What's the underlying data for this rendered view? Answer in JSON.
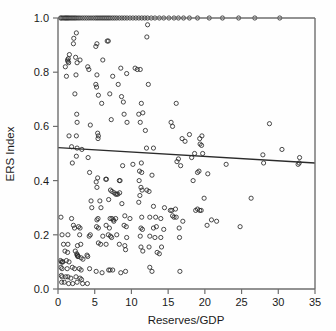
{
  "chart_data": {
    "type": "scatter",
    "title": "",
    "xlabel": "Reserves/GDP",
    "ylabel": "ERS Index",
    "xlim": [
      0,
      35
    ],
    "ylim": [
      0,
      1
    ],
    "xticks": [
      0,
      5,
      10,
      15,
      20,
      25,
      30,
      35
    ],
    "xticklabels": [
      "0",
      "5",
      "10",
      "15",
      "20",
      "25",
      "30",
      "35"
    ],
    "yticks": [
      0.0,
      0.2,
      0.4,
      0.6,
      0.8,
      1.0
    ],
    "yticklabels": [
      "0.0",
      "0.2",
      "0.4",
      "0.6",
      "0.8",
      "1.0"
    ],
    "grid": false,
    "legend": null,
    "marker": "open-circle",
    "marker_color": "#2b2b2b",
    "series": [
      {
        "name": "observations",
        "points": [
          [
            0.35,
            1.0
          ],
          [
            0.5,
            1.0
          ],
          [
            0.7,
            1.0
          ],
          [
            0.9,
            1.0
          ],
          [
            1.05,
            1.0
          ],
          [
            1.2,
            1.0
          ],
          [
            1.35,
            1.0
          ],
          [
            1.5,
            1.0
          ],
          [
            1.7,
            1.0
          ],
          [
            1.9,
            1.0
          ],
          [
            2.1,
            1.0
          ],
          [
            2.3,
            1.0
          ],
          [
            2.5,
            1.0
          ],
          [
            2.75,
            1.0
          ],
          [
            3.0,
            1.0
          ],
          [
            3.3,
            1.0
          ],
          [
            3.6,
            1.0
          ],
          [
            3.9,
            1.0
          ],
          [
            4.2,
            1.0
          ],
          [
            4.5,
            1.0
          ],
          [
            4.8,
            1.0
          ],
          [
            5.1,
            1.0
          ],
          [
            5.35,
            1.0
          ],
          [
            5.6,
            1.0
          ],
          [
            5.85,
            1.0
          ],
          [
            6.1,
            1.0
          ],
          [
            6.35,
            1.0
          ],
          [
            6.6,
            1.0
          ],
          [
            6.85,
            1.0
          ],
          [
            7.1,
            1.0
          ],
          [
            7.4,
            1.0
          ],
          [
            7.7,
            1.0
          ],
          [
            8.0,
            1.0
          ],
          [
            8.35,
            1.0
          ],
          [
            8.7,
            1.0
          ],
          [
            9.05,
            1.0
          ],
          [
            9.4,
            1.0
          ],
          [
            9.8,
            1.0
          ],
          [
            10.2,
            1.0
          ],
          [
            10.6,
            1.0
          ],
          [
            11.0,
            1.0
          ],
          [
            11.4,
            1.0
          ],
          [
            11.8,
            1.0
          ],
          [
            12.2,
            1.0
          ],
          [
            12.7,
            1.0
          ],
          [
            13.2,
            1.0
          ],
          [
            13.8,
            1.0
          ],
          [
            14.4,
            1.0
          ],
          [
            15.1,
            1.0
          ],
          [
            15.8,
            1.0
          ],
          [
            16.4,
            1.0
          ],
          [
            17.1,
            1.0
          ],
          [
            17.9,
            1.0
          ],
          [
            19.0,
            1.0
          ],
          [
            20.6,
            1.0
          ],
          [
            22.4,
            1.0
          ],
          [
            24.6,
            1.0
          ],
          [
            26.8,
            1.0
          ],
          [
            30.2,
            1.0
          ],
          [
            12.2,
            0.975
          ],
          [
            2.5,
            0.945
          ],
          [
            2.15,
            0.925
          ],
          [
            2.1,
            0.905
          ],
          [
            12.1,
            0.93
          ],
          [
            5.3,
            0.905
          ],
          [
            6.7,
            0.915
          ],
          [
            6.85,
            0.915
          ],
          [
            5.15,
            0.895
          ],
          [
            1.55,
            0.865
          ],
          [
            1.4,
            0.85
          ],
          [
            1.3,
            0.845
          ],
          [
            1.35,
            0.84
          ],
          [
            1.45,
            0.835
          ],
          [
            2.4,
            0.855
          ],
          [
            3.0,
            0.845
          ],
          [
            6.1,
            0.845
          ],
          [
            1.0,
            0.82
          ],
          [
            2.6,
            0.835
          ],
          [
            4.05,
            0.82
          ],
          [
            4.2,
            0.81
          ],
          [
            8.55,
            0.815
          ],
          [
            10.5,
            0.815
          ],
          [
            11.2,
            0.81
          ],
          [
            9.35,
            0.795
          ],
          [
            10.8,
            0.81
          ],
          [
            1.15,
            0.785
          ],
          [
            2.45,
            0.79
          ],
          [
            5.3,
            0.79
          ],
          [
            7.45,
            0.785
          ],
          [
            5.15,
            0.755
          ],
          [
            5.25,
            0.745
          ],
          [
            8.2,
            0.755
          ],
          [
            12.3,
            0.755
          ],
          [
            2.3,
            0.72
          ],
          [
            5.5,
            0.715
          ],
          [
            7.05,
            0.72
          ],
          [
            8.65,
            0.71
          ],
          [
            5.95,
            0.685
          ],
          [
            8.9,
            0.69
          ],
          [
            11.35,
            0.685
          ],
          [
            16.1,
            0.685
          ],
          [
            2.55,
            0.645
          ],
          [
            9.0,
            0.645
          ],
          [
            11.0,
            0.645
          ],
          [
            11.55,
            0.65
          ],
          [
            2.6,
            0.615
          ],
          [
            4.4,
            0.605
          ],
          [
            7.25,
            0.625
          ],
          [
            9.4,
            0.615
          ],
          [
            11.2,
            0.615
          ],
          [
            15.4,
            0.615
          ],
          [
            28.8,
            0.61
          ],
          [
            11.9,
            0.585
          ],
          [
            15.6,
            0.6
          ],
          [
            1.5,
            0.565
          ],
          [
            2.5,
            0.565
          ],
          [
            5.4,
            0.575
          ],
          [
            5.5,
            0.565
          ],
          [
            5.45,
            0.555
          ],
          [
            17.9,
            0.57
          ],
          [
            19.3,
            0.555
          ],
          [
            19.6,
            0.565
          ],
          [
            16.9,
            0.555
          ],
          [
            17.3,
            0.545
          ],
          [
            19.35,
            0.535
          ],
          [
            19.55,
            0.53
          ],
          [
            12.05,
            0.52
          ],
          [
            13.0,
            0.52
          ],
          [
            1.85,
            0.525
          ],
          [
            2.6,
            0.52
          ],
          [
            3.25,
            0.515
          ],
          [
            18.6,
            0.5
          ],
          [
            19.7,
            0.5
          ],
          [
            27.9,
            0.495
          ],
          [
            30.5,
            0.515
          ],
          [
            2.5,
            0.49
          ],
          [
            4.1,
            0.485
          ],
          [
            16.4,
            0.48
          ],
          [
            18.2,
            0.485
          ],
          [
            32.9,
            0.485
          ],
          [
            1.95,
            0.465
          ],
          [
            11.35,
            0.465
          ],
          [
            16.2,
            0.47
          ],
          [
            22.9,
            0.46
          ],
          [
            28.0,
            0.465
          ],
          [
            32.7,
            0.46
          ],
          [
            32.85,
            0.465
          ],
          [
            8.8,
            0.455
          ],
          [
            10.2,
            0.46
          ],
          [
            16.7,
            0.455
          ],
          [
            4.3,
            0.43
          ],
          [
            11.1,
            0.435
          ],
          [
            11.4,
            0.43
          ],
          [
            19.0,
            0.43
          ],
          [
            19.2,
            0.435
          ],
          [
            20.4,
            0.425
          ],
          [
            12.8,
            0.42
          ],
          [
            5.4,
            0.41
          ],
          [
            5.2,
            0.395
          ],
          [
            6.5,
            0.405
          ],
          [
            6.6,
            0.405
          ],
          [
            8.35,
            0.4
          ],
          [
            8.45,
            0.4
          ],
          [
            11.05,
            0.4
          ],
          [
            18.4,
            0.4
          ],
          [
            5.3,
            0.375
          ],
          [
            11.3,
            0.375
          ],
          [
            11.45,
            0.365
          ],
          [
            12.1,
            0.365
          ],
          [
            7.15,
            0.365
          ],
          [
            7.35,
            0.36
          ],
          [
            7.65,
            0.355
          ],
          [
            7.85,
            0.35
          ],
          [
            8.0,
            0.35
          ],
          [
            8.15,
            0.35
          ],
          [
            8.4,
            0.355
          ],
          [
            11.15,
            0.345
          ],
          [
            12.4,
            0.36
          ],
          [
            19.9,
            0.335
          ],
          [
            26.3,
            0.335
          ],
          [
            4.5,
            0.325
          ],
          [
            5.7,
            0.325
          ],
          [
            6.9,
            0.33
          ],
          [
            8.7,
            0.315
          ],
          [
            11.0,
            0.32
          ],
          [
            13.0,
            0.305
          ],
          [
            14.5,
            0.3
          ],
          [
            15.3,
            0.29
          ],
          [
            15.5,
            0.29
          ],
          [
            16.0,
            0.295
          ],
          [
            18.75,
            0.29
          ],
          [
            19.0,
            0.295
          ],
          [
            19.3,
            0.29
          ],
          [
            19.5,
            0.29
          ],
          [
            4.6,
            0.3
          ],
          [
            5.85,
            0.3
          ],
          [
            0.4,
            0.265
          ],
          [
            1.85,
            0.26
          ],
          [
            5.3,
            0.255
          ],
          [
            5.45,
            0.26
          ],
          [
            7.1,
            0.26
          ],
          [
            7.35,
            0.26
          ],
          [
            7.55,
            0.255
          ],
          [
            7.6,
            0.25
          ],
          [
            7.85,
            0.26
          ],
          [
            9.1,
            0.27
          ],
          [
            9.8,
            0.26
          ],
          [
            11.4,
            0.265
          ],
          [
            12.5,
            0.265
          ],
          [
            13.3,
            0.265
          ],
          [
            14.0,
            0.26
          ],
          [
            15.6,
            0.27
          ],
          [
            15.8,
            0.265
          ],
          [
            16.1,
            0.265
          ],
          [
            20.9,
            0.255
          ],
          [
            21.6,
            0.25
          ],
          [
            17.0,
            0.25
          ],
          [
            24.8,
            0.23
          ],
          [
            2.1,
            0.235
          ],
          [
            2.25,
            0.225
          ],
          [
            2.8,
            0.23
          ],
          [
            3.0,
            0.225
          ],
          [
            5.25,
            0.23
          ],
          [
            5.5,
            0.225
          ],
          [
            6.55,
            0.235
          ],
          [
            7.0,
            0.225
          ],
          [
            9.0,
            0.235
          ],
          [
            9.3,
            0.23
          ],
          [
            11.3,
            0.225
          ],
          [
            11.5,
            0.22
          ],
          [
            13.0,
            0.225
          ],
          [
            13.4,
            0.23
          ],
          [
            14.4,
            0.22
          ],
          [
            16.5,
            0.225
          ],
          [
            20.3,
            0.235
          ],
          [
            0.55,
            0.2
          ],
          [
            1.35,
            0.2
          ],
          [
            2.95,
            0.2
          ],
          [
            4.25,
            0.195
          ],
          [
            4.4,
            0.2
          ],
          [
            6.1,
            0.195
          ],
          [
            6.85,
            0.2
          ],
          [
            7.15,
            0.195
          ],
          [
            7.3,
            0.19
          ],
          [
            8.0,
            0.2
          ],
          [
            9.35,
            0.19
          ],
          [
            11.2,
            0.195
          ],
          [
            12.5,
            0.195
          ],
          [
            13.2,
            0.19
          ],
          [
            14.0,
            0.19
          ],
          [
            16.55,
            0.19
          ],
          [
            0.75,
            0.165
          ],
          [
            1.35,
            0.165
          ],
          [
            2.65,
            0.16
          ],
          [
            3.1,
            0.165
          ],
          [
            5.5,
            0.17
          ],
          [
            5.8,
            0.165
          ],
          [
            6.55,
            0.165
          ],
          [
            8.35,
            0.165
          ],
          [
            9.1,
            0.16
          ],
          [
            11.3,
            0.155
          ],
          [
            12.4,
            0.155
          ],
          [
            14.1,
            0.155
          ],
          [
            0.95,
            0.14
          ],
          [
            1.3,
            0.135
          ],
          [
            2.35,
            0.14
          ],
          [
            2.55,
            0.13
          ],
          [
            2.65,
            0.125
          ],
          [
            2.7,
            0.12
          ],
          [
            3.95,
            0.125
          ],
          [
            4.05,
            0.12
          ],
          [
            9.2,
            0.145
          ],
          [
            11.55,
            0.14
          ],
          [
            13.5,
            0.135
          ],
          [
            13.8,
            0.13
          ],
          [
            0.35,
            0.105
          ],
          [
            0.45,
            0.1
          ],
          [
            0.6,
            0.1
          ],
          [
            0.65,
            0.1
          ],
          [
            1.15,
            0.105
          ],
          [
            1.5,
            0.1
          ],
          [
            2.6,
            0.125
          ],
          [
            2.75,
            0.12
          ],
          [
            3.15,
            0.115
          ],
          [
            3.4,
            0.11
          ],
          [
            0.4,
            0.08
          ],
          [
            0.55,
            0.075
          ],
          [
            1.25,
            0.075
          ],
          [
            1.95,
            0.08
          ],
          [
            2.25,
            0.075
          ],
          [
            2.9,
            0.075
          ],
          [
            3.15,
            0.07
          ],
          [
            4.3,
            0.075
          ],
          [
            5.2,
            0.065
          ],
          [
            6.0,
            0.06
          ],
          [
            6.9,
            0.07
          ],
          [
            7.1,
            0.07
          ],
          [
            7.45,
            0.07
          ],
          [
            8.55,
            0.06
          ],
          [
            9.2,
            0.065
          ],
          [
            12.5,
            0.08
          ],
          [
            12.8,
            0.065
          ],
          [
            16.6,
            0.065
          ],
          [
            0.45,
            0.05
          ],
          [
            0.55,
            0.045
          ],
          [
            1.05,
            0.045
          ],
          [
            1.35,
            0.045
          ],
          [
            1.75,
            0.04
          ],
          [
            2.45,
            0.045
          ],
          [
            3.0,
            0.04
          ],
          [
            3.2,
            0.035
          ],
          [
            0.5,
            0.025
          ],
          [
            0.85,
            0.025
          ],
          [
            1.45,
            0.02
          ],
          [
            2.0,
            0.02
          ],
          [
            2.6,
            0.025
          ],
          [
            3.35,
            0.02
          ],
          [
            4.0,
            0.02
          ]
        ]
      }
    ],
    "fit_line": {
      "name": "linear-fit",
      "x0": 0.0,
      "y0": 0.522,
      "x1": 35.0,
      "y1": 0.465
    }
  }
}
